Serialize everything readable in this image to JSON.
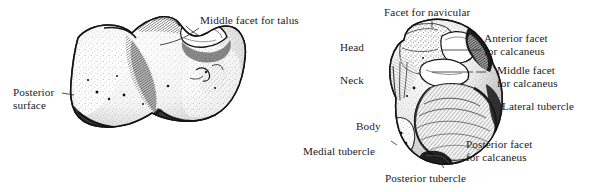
{
  "figure": {
    "background_color": "#ffffff",
    "ink_color": "#1c1c1c",
    "panels": [
      {
        "id": "calcaneus-panel",
        "name": "calcaneus-superior-view",
        "labels": [
          {
            "key": "middle_facet_for_talus",
            "text": "Middle facet for talus"
          },
          {
            "key": "posterior_surface_line1",
            "text": "Posterior"
          },
          {
            "key": "posterior_surface_line2",
            "text": "surface"
          }
        ]
      },
      {
        "id": "talus-panel",
        "name": "talus-inferior-view",
        "labels": [
          {
            "key": "facet_for_navicular",
            "text": "Facet for navicular"
          },
          {
            "key": "head",
            "text": "Head"
          },
          {
            "key": "neck",
            "text": "Neck"
          },
          {
            "key": "body",
            "text": "Body"
          },
          {
            "key": "medial_tubercle",
            "text": "Medial tubercle"
          },
          {
            "key": "posterior_tubercle",
            "text": "Posterior tubercle"
          },
          {
            "key": "anterior_facet_line1",
            "text": "Anterior facet"
          },
          {
            "key": "anterior_facet_line2",
            "text": "for calcaneus"
          },
          {
            "key": "middle_facet_line1",
            "text": "Middle facet"
          },
          {
            "key": "middle_facet_line2",
            "text": "for calcaneus"
          },
          {
            "key": "lateral_tubercle",
            "text": "Lateral tubercle"
          },
          {
            "key": "posterior_facet_line1",
            "text": "Posterior facet"
          },
          {
            "key": "posterior_facet_line2",
            "text": "for calcaneus"
          }
        ]
      }
    ]
  },
  "labels": {
    "middle_facet_for_talus": "Middle facet for talus",
    "posterior_surface_line1": "Posterior",
    "posterior_surface_line2": "surface",
    "facet_for_navicular": "Facet for navicular",
    "head": "Head",
    "neck": "Neck",
    "body": "Body",
    "medial_tubercle": "Medial tubercle",
    "posterior_tubercle": "Posterior tubercle",
    "anterior_facet_line1": "Anterior facet",
    "anterior_facet_line2": "for calcaneus",
    "middle_facet_line1": "Middle facet",
    "middle_facet_line2": "for calcaneus",
    "lateral_tubercle": "Lateral tubercle",
    "posterior_facet_line1": "Posterior facet",
    "posterior_facet_line2": "for calcaneus"
  },
  "icons": {
    "calcaneus_bone": "calcaneus-bone-illustration",
    "talus_bone": "talus-bone-illustration",
    "leader_line": "leader-line"
  }
}
